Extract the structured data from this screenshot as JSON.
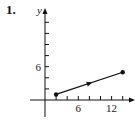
{
  "problem": {
    "number": "1."
  },
  "colors": {
    "ink": "#111111",
    "axis": "#222222"
  },
  "chart_data": {
    "type": "line",
    "title": "",
    "xlabel": "",
    "ylabel": "y",
    "xlim": [
      0,
      15
    ],
    "ylim": [
      -2,
      16
    ],
    "x_ticks": [
      2,
      4,
      6,
      8,
      10,
      12,
      14
    ],
    "y_ticks": [
      2,
      4,
      6,
      8,
      10,
      12,
      14
    ],
    "x_tick_labels": [
      {
        "value": 6,
        "label": "6"
      },
      {
        "value": 12,
        "label": "12"
      }
    ],
    "y_tick_labels": [
      {
        "value": 6,
        "label": "6"
      }
    ],
    "grid": false,
    "series": [
      {
        "name": "curve",
        "points": [
          {
            "x": 2,
            "y": 1
          },
          {
            "x": 14,
            "y": 5
          }
        ],
        "start_marker": "filled-dot",
        "end_marker": "filled-dot",
        "direction_arrow_at": {
          "x": 8,
          "y": 3
        }
      }
    ]
  }
}
